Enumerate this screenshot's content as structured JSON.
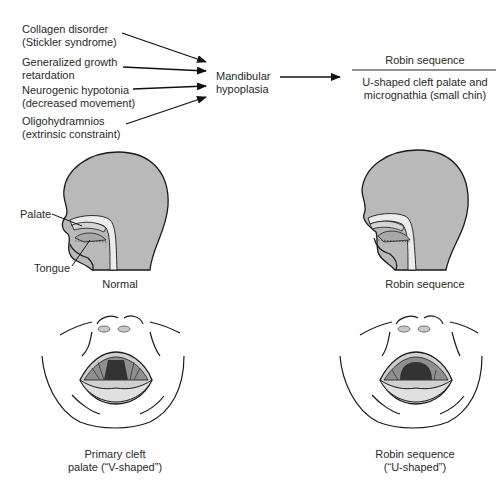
{
  "causes": [
    {
      "line1": "Collagen disorder",
      "line2": "(Stickler syndrome)"
    },
    {
      "line1": "Generalized growth",
      "line2": "retardation"
    },
    {
      "line1": "Neurogenic hypotonia",
      "line2": "(decreased movement)"
    },
    {
      "line1": "Oligohydramnios",
      "line2": "(extrinsic constraint)"
    }
  ],
  "intermediate": {
    "line1": "Mandibular",
    "line2": "hypoplasia"
  },
  "result": {
    "title": "Robin sequence",
    "line1": "U-shaped cleft palate and",
    "line2": "micrognathia (small chin)"
  },
  "profiles": {
    "normal": {
      "caption": "Normal",
      "palate_label": "Palate",
      "tongue_label": "Tongue"
    },
    "robin": {
      "caption": "Robin sequence"
    }
  },
  "frontal_views": {
    "primary_cleft": {
      "line1": "Primary cleft",
      "line2": "palate (“V-shaped”)"
    },
    "robin": {
      "line1": "Robin sequence",
      "line2": "(“U-shaped”)"
    }
  },
  "colors": {
    "head_fill": "#b9b9b9",
    "outline": "#1a1a1a",
    "light_fill": "#e6e6e6",
    "dark_fill": "#333333"
  }
}
